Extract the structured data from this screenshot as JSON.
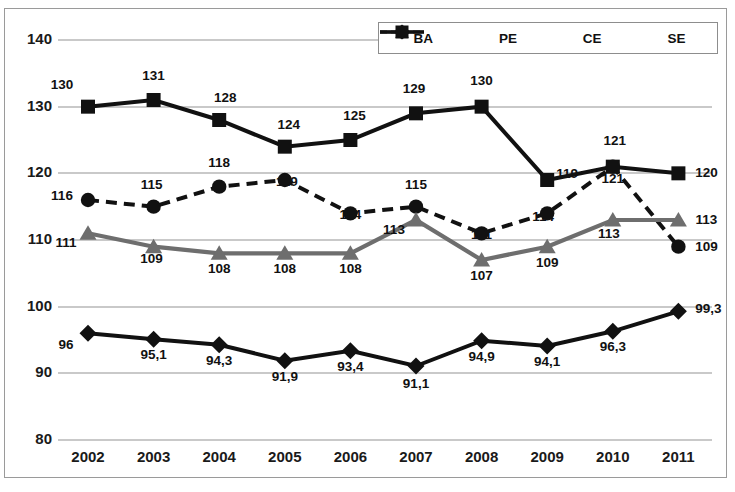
{
  "chart_data": {
    "type": "line",
    "title": "",
    "xlabel": "",
    "ylabel": "",
    "categories": [
      "2002",
      "2003",
      "2004",
      "2005",
      "2006",
      "2007",
      "2008",
      "2009",
      "2010",
      "2011"
    ],
    "yticks": [
      "80",
      "90",
      "100",
      "110",
      "120",
      "130",
      "140"
    ],
    "ylim": [
      80,
      140
    ],
    "grid": true,
    "legend_position": "top-right",
    "decimal_separator": ",",
    "series": [
      {
        "name": "BA",
        "style": "dashed",
        "marker": "circle",
        "color": "#111111",
        "values": [
          116,
          115,
          118,
          119,
          114,
          115,
          111,
          114,
          121,
          109
        ],
        "labels": [
          "116",
          "115",
          "118",
          "119",
          "114",
          "115",
          "111",
          "114",
          "121",
          "109"
        ]
      },
      {
        "name": "PE",
        "style": "solid",
        "marker": "triangle",
        "color": "#6e6e6e",
        "values": [
          111,
          109,
          108,
          108,
          108,
          113,
          107,
          109,
          113,
          113
        ],
        "labels": [
          "111",
          "109",
          "108",
          "108",
          "108",
          "113",
          "107",
          "109",
          "113",
          "113"
        ]
      },
      {
        "name": "CE",
        "style": "solid",
        "marker": "diamond",
        "color": "#111111",
        "values": [
          96,
          95.1,
          94.3,
          91.9,
          93.4,
          91.1,
          94.9,
          94.1,
          96.3,
          99.3
        ],
        "labels": [
          "96",
          "95,1",
          "94,3",
          "91,9",
          "93,4",
          "91,1",
          "94,9",
          "94,1",
          "96,3",
          "99,3"
        ]
      },
      {
        "name": "SE",
        "style": "solid",
        "marker": "square",
        "color": "#111111",
        "values": [
          130,
          131,
          128,
          124,
          125,
          129,
          130,
          119,
          121,
          120
        ],
        "labels": [
          "130",
          "131",
          "128",
          "124",
          "125",
          "129",
          "130",
          "119",
          "121",
          "120"
        ]
      }
    ]
  },
  "legend": {
    "items": [
      {
        "label": "BA"
      },
      {
        "label": "PE"
      },
      {
        "label": "CE"
      },
      {
        "label": "SE"
      }
    ]
  },
  "colors": {
    "grid": "#c9c9c9",
    "border": "#9a9a9a",
    "dark": "#111111",
    "gray_series": "#6e6e6e"
  }
}
